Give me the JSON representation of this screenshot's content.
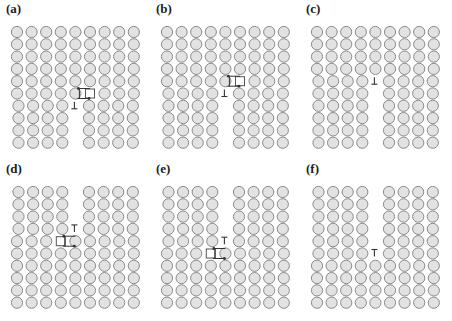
{
  "figure": {
    "panels": [
      {
        "id": "a",
        "label": "(a)",
        "offset": [
          0,
          0
        ],
        "gap_col": 4,
        "mode": "bottom",
        "split_row": 6,
        "symbol": "perp",
        "symbol_row": 6,
        "vacancy": true,
        "vacancy_row": 5,
        "arrow_dir": "left-top"
      },
      {
        "id": "b",
        "label": "(b)",
        "offset": [
          150,
          0
        ],
        "gap_col": 4,
        "mode": "bottom",
        "split_row": 5,
        "symbol": "perp",
        "symbol_row": 5,
        "vacancy": true,
        "vacancy_row": 4,
        "arrow_dir": "right-top"
      },
      {
        "id": "c",
        "label": "(c)",
        "offset": [
          300,
          0
        ],
        "gap_col": 4,
        "mode": "bottom",
        "split_row": 4,
        "symbol": "perp",
        "symbol_row": 4,
        "vacancy": false
      },
      {
        "id": "d",
        "label": "(d)",
        "offset": [
          0,
          160
        ],
        "gap_col": 4,
        "mode": "top",
        "split_row": 4,
        "symbol": "tee",
        "symbol_row": 3,
        "vacancy": true,
        "vacancy_row": 4,
        "arrow_dir": "right-top"
      },
      {
        "id": "e",
        "label": "(e)",
        "offset": [
          150,
          160
        ],
        "gap_col": 4,
        "mode": "top",
        "split_row": 5,
        "symbol": "tee",
        "symbol_row": 4,
        "vacancy": true,
        "vacancy_row": 5,
        "arrow_dir": "right-top"
      },
      {
        "id": "f",
        "label": "(f)",
        "offset": [
          300,
          160
        ],
        "gap_col": 4,
        "mode": "top",
        "split_row": 6,
        "symbol": "tee",
        "symbol_row": 5,
        "vacancy": false
      }
    ],
    "grid": {
      "cols": 9,
      "rows": 10,
      "x0": 17,
      "y0": 32,
      "dx": 14.6,
      "dy": 12.3,
      "r": 5.6
    },
    "colors": {
      "atom_fill": "#e2e2e2",
      "atom_stroke": "#8a8a8a",
      "symbol": "#333333"
    }
  }
}
